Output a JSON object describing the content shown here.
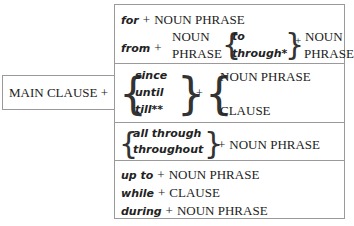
{
  "main_clause": {
    "label": "MAIN CLAUSE +"
  },
  "rows": [
    {
      "line1": {
        "prep": "for",
        "plus": "+",
        "object": "NOUN PHRASE"
      },
      "line2": {
        "prep": "from",
        "plus": "+",
        "object_top": "NOUN",
        "object_bottom": "PHRASE",
        "options": [
          "to",
          "through*"
        ],
        "plus2": "+",
        "object2_top": "NOUN",
        "object2_bottom": "PHRASE"
      }
    },
    {
      "options": [
        "since",
        "until",
        "till**"
      ],
      "plus": "+",
      "objects": [
        "NOUN PHRASE",
        "CLAUSE"
      ]
    },
    {
      "options": [
        "all through",
        "throughout"
      ],
      "plus": "+",
      "object": "NOUN PHRASE"
    },
    {
      "lines": [
        {
          "prep": "up to",
          "plus": "+",
          "object": "NOUN PHRASE"
        },
        {
          "prep": "while",
          "plus": "+",
          "object": "CLAUSE"
        },
        {
          "prep": "during",
          "plus": "+",
          "object": "NOUN PHRASE"
        }
      ]
    }
  ]
}
